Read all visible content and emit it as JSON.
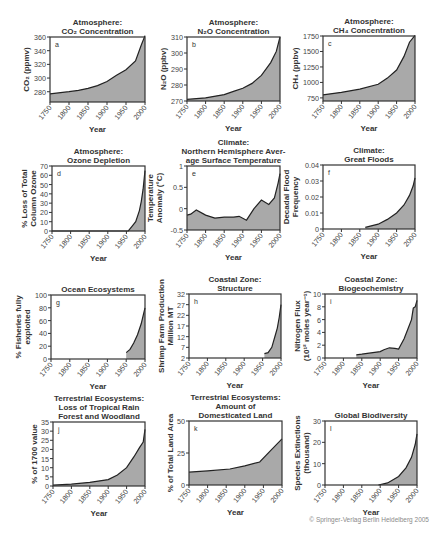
{
  "figure": {
    "credit": "© Springer-Verlag Berlin Heidelberg 2005",
    "fill_color": "#a9a9a9",
    "line_color": "#222222",
    "x_ticks": [
      1750,
      1800,
      1850,
      1900,
      1950,
      2000
    ],
    "xlabel": "Year"
  },
  "chart_data": [
    {
      "id": "a",
      "type": "area",
      "title": [
        "Atmosphere:",
        "CO₂ Concentration"
      ],
      "ylabel": [
        "CO₂ (ppmv)"
      ],
      "xlabel": "Year",
      "xlim": [
        1750,
        2000
      ],
      "ylim": [
        265,
        360
      ],
      "y_ticks": [
        280,
        300,
        320,
        340,
        360
      ],
      "x": [
        1750,
        1800,
        1825,
        1850,
        1875,
        1900,
        1925,
        1950,
        1975,
        1990,
        2000
      ],
      "y": [
        277,
        280,
        282,
        285,
        289,
        295,
        304,
        312,
        325,
        348,
        362
      ],
      "frame": [
        50,
        37,
        95,
        65
      ]
    },
    {
      "id": "b",
      "type": "area",
      "title": [
        "Atmosphere:",
        "N₂O Concentration"
      ],
      "ylabel": [
        "N₂O (ppbv)"
      ],
      "xlabel": "Year",
      "xlim": [
        1750,
        2000
      ],
      "ylim": [
        270,
        310
      ],
      "y_ticks": [
        270,
        280,
        290,
        300,
        310
      ],
      "x": [
        1750,
        1800,
        1850,
        1875,
        1900,
        1925,
        1950,
        1975,
        1990,
        2000
      ],
      "y": [
        271,
        272,
        274,
        276,
        278,
        281,
        286,
        294,
        301,
        310
      ],
      "frame": [
        187,
        37,
        93,
        64
      ]
    },
    {
      "id": "c",
      "type": "area",
      "title": [
        "Atmosphere:",
        "CH₄ Concentration"
      ],
      "ylabel": [
        "CH₄ (ppbv)"
      ],
      "xlabel": "Year",
      "xlim": [
        1750,
        2000
      ],
      "ylim": [
        700,
        1750
      ],
      "y_ticks": [
        750,
        1000,
        1250,
        1500,
        1750
      ],
      "x": [
        1750,
        1800,
        1850,
        1900,
        1925,
        1950,
        1970,
        1985,
        2000
      ],
      "y": [
        800,
        840,
        890,
        970,
        1070,
        1200,
        1420,
        1650,
        1760
      ],
      "frame": [
        323,
        36,
        92,
        65
      ]
    },
    {
      "id": "d",
      "type": "area",
      "title": [
        "Atmosphere:",
        "Ozone Depletion"
      ],
      "ylabel": [
        "% Loss of Total",
        "Column Ozone"
      ],
      "xlabel": "Year",
      "xlim": [
        1750,
        2000
      ],
      "ylim": [
        0,
        70
      ],
      "y_ticks": [
        0,
        10,
        20,
        30,
        40,
        50,
        60,
        70
      ],
      "x": [
        1750,
        1955,
        1965,
        1975,
        1985,
        1990,
        1995,
        2000
      ],
      "y": [
        0,
        0,
        5,
        10,
        22,
        32,
        45,
        65
      ],
      "frame": [
        52,
        166,
        93,
        65
      ]
    },
    {
      "id": "e",
      "type": "area",
      "title": [
        "Climate:",
        "Northern Hemisphere Aver-",
        "age Surface Temperature"
      ],
      "ylabel": [
        "Temperature",
        "Anomaly (°C)"
      ],
      "xlabel": "Year",
      "xlim": [
        1750,
        2000
      ],
      "ylim": [
        -0.5,
        1.0
      ],
      "y_ticks": [
        -0.5,
        0,
        0.5,
        1.0
      ],
      "x": [
        1750,
        1760,
        1775,
        1800,
        1825,
        1850,
        1875,
        1890,
        1910,
        1930,
        1950,
        1970,
        1985,
        1995,
        2000
      ],
      "y": [
        -0.15,
        -0.13,
        -0.03,
        -0.15,
        -0.22,
        -0.2,
        -0.2,
        -0.18,
        -0.27,
        0.0,
        0.2,
        0.1,
        0.25,
        0.6,
        0.82
      ],
      "frame": [
        187,
        166,
        93,
        64
      ]
    },
    {
      "id": "f",
      "type": "area",
      "title": [
        "Climate:",
        "Great Floods"
      ],
      "ylabel": [
        "Decadal Flood",
        "Frequency"
      ],
      "xlabel": "Year",
      "xlim": [
        1750,
        2000
      ],
      "ylim": [
        0,
        0.04
      ],
      "y_ticks": [
        0,
        0.01,
        0.02,
        0.03,
        0.04
      ],
      "x": [
        1865,
        1900,
        1925,
        1950,
        1970,
        1985,
        1995,
        2000
      ],
      "y": [
        0.001,
        0.003,
        0.006,
        0.01,
        0.015,
        0.021,
        0.027,
        0.032
      ],
      "frame": [
        323,
        165,
        92,
        64
      ]
    },
    {
      "id": "g",
      "type": "area",
      "title": [
        "Ocean Ecosystems"
      ],
      "ylabel": [
        "% Fisheries fully",
        "exploited"
      ],
      "xlabel": "Year",
      "xlim": [
        1750,
        2000
      ],
      "ylim": [
        0,
        100
      ],
      "y_ticks": [
        0,
        20,
        40,
        60,
        80,
        100
      ],
      "x": [
        1950,
        1960,
        1970,
        1980,
        1990,
        2000
      ],
      "y": [
        10,
        15,
        25,
        38,
        55,
        80
      ],
      "frame": [
        51,
        295,
        94,
        64
      ]
    },
    {
      "id": "h",
      "type": "area",
      "title": [
        "Coastal Zone:",
        "Structure"
      ],
      "ylabel": [
        "Shrimp Farm Production",
        "Million MT"
      ],
      "xlabel": "Year",
      "xlim": [
        1750,
        2000
      ],
      "ylim": [
        2,
        32
      ],
      "y_ticks": [
        2,
        7,
        12,
        17,
        22,
        27,
        32
      ],
      "x": [
        1955,
        1965,
        1975,
        1985,
        1990,
        1995,
        2000
      ],
      "y": [
        4,
        4.5,
        7,
        13,
        16,
        21,
        27
      ],
      "frame": [
        189,
        294,
        92,
        64
      ]
    },
    {
      "id": "i",
      "type": "area",
      "title": [
        "Coastal Zone:",
        "Biogeochemistry"
      ],
      "ylabel": [
        "Nitrogen Flux",
        "(10¹² moles year⁻¹)"
      ],
      "xlabel": "Year",
      "xlim": [
        1750,
        2000
      ],
      "ylim": [
        0,
        10
      ],
      "y_ticks": [
        0,
        2,
        4,
        6,
        8,
        10
      ],
      "x": [
        1835,
        1850,
        1875,
        1900,
        1910,
        1925,
        1940,
        1950,
        1965,
        1975,
        1985,
        1990,
        1995,
        2000
      ],
      "y": [
        0.5,
        0.6,
        0.8,
        1.0,
        1.3,
        1.6,
        1.5,
        1.4,
        3.0,
        4.5,
        6.0,
        7.8,
        8.0,
        9.0
      ],
      "frame": [
        325,
        294,
        92,
        64
      ]
    },
    {
      "id": "j",
      "type": "area",
      "title": [
        "Terrestrial Ecosystems:",
        "Loss of Tropical Rain",
        "Forest and Woodland"
      ],
      "ylabel": [
        "% of 1700 value"
      ],
      "xlabel": "Year",
      "xlim": [
        1750,
        2000
      ],
      "ylim": [
        0,
        35
      ],
      "y_ticks": [
        0,
        5,
        10,
        15,
        20,
        25,
        30,
        35
      ],
      "x": [
        1750,
        1800,
        1850,
        1900,
        1925,
        1950,
        1970,
        1985,
        1995,
        2000
      ],
      "y": [
        0.5,
        1,
        2,
        3.5,
        6,
        10,
        16,
        21,
        24,
        31
      ],
      "frame": [
        53,
        422,
        92,
        64
      ]
    },
    {
      "id": "k",
      "type": "area",
      "title": [
        "Terrestrial Ecosystems:",
        "Amount of",
        "Domesticated Land"
      ],
      "ylabel": [
        "% of Total Land Area"
      ],
      "xlabel": "Year",
      "xlim": [
        1750,
        2000
      ],
      "ylim": [
        0,
        50
      ],
      "y_ticks": [
        0,
        25,
        50
      ],
      "x": [
        1750,
        1800,
        1860,
        1900,
        1940,
        1970,
        2000
      ],
      "y": [
        10,
        11,
        12.5,
        15,
        18,
        27,
        36
      ],
      "frame": [
        189,
        421,
        93,
        64
      ]
    },
    {
      "id": "l",
      "type": "area",
      "title": [
        "Global Biodiversity"
      ],
      "ylabel": [
        "Species Extinctions",
        "(thousand)"
      ],
      "xlabel": "Year",
      "xlim": [
        1750,
        2000
      ],
      "ylim": [
        0,
        30
      ],
      "y_ticks": [
        0,
        10,
        20,
        30
      ],
      "x": [
        1895,
        1920,
        1950,
        1970,
        1985,
        1995,
        2000
      ],
      "y": [
        0,
        1,
        4,
        8,
        13,
        19,
        24
      ],
      "frame": [
        325,
        421,
        92,
        64
      ]
    }
  ]
}
